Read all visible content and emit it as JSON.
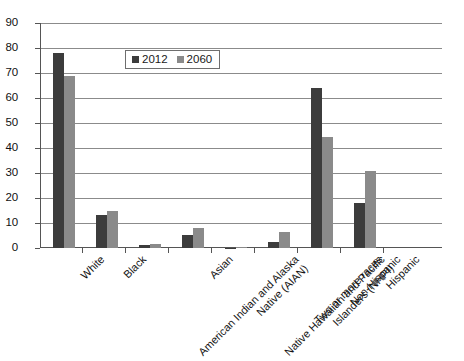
{
  "chart_data": {
    "type": "bar",
    "title": "",
    "subtitle": "",
    "xlabel": "",
    "ylabel": "",
    "ylim": [
      0,
      90
    ],
    "yticks": [
      0,
      10,
      20,
      30,
      40,
      50,
      60,
      70,
      80,
      90
    ],
    "ytick_labels": [
      "0",
      "10",
      "20",
      "30",
      "40",
      "50",
      "60",
      "70",
      "80",
      "90"
    ],
    "grid": "horizontal",
    "legend_position": "upper-center-inside",
    "categories": [
      "White",
      "Black",
      "American Indian and Alaska Native (AIAN)",
      "Asian",
      "Native Hawaiian and Pacific Islanders (NHPI)",
      "Two or more races",
      "Non-Hispanic",
      "Hispanic"
    ],
    "category_label_lines": [
      [
        "White"
      ],
      [
        "Black"
      ],
      [
        "American Indian and Alaska",
        "Native (AIAN)"
      ],
      [
        "Asian"
      ],
      [
        "Native Hawaiian and Pacific",
        "Islanders (NHPI)"
      ],
      [
        "Two or more races"
      ],
      [
        "Non-Hispanic"
      ],
      [
        "Hispanic"
      ]
    ],
    "series": [
      {
        "name": "2012",
        "color": "#3c3c3c",
        "values": [
          78.0,
          13.1,
          1.2,
          5.3,
          0.2,
          2.4,
          64.0,
          17.9
        ]
      },
      {
        "name": "2060",
        "color": "#8a8a8a",
        "values": [
          69.0,
          14.7,
          1.5,
          8.2,
          0.3,
          6.4,
          44.5,
          31.0
        ]
      }
    ]
  },
  "legend": {
    "entries": [
      {
        "label": "2012"
      },
      {
        "label": "2060"
      }
    ]
  },
  "colors": {
    "series_2012": "#3c3c3c",
    "series_2060": "#8a8a8a",
    "gridline": "#8b8b8b",
    "axis": "#555555",
    "background": "#ffffff"
  }
}
